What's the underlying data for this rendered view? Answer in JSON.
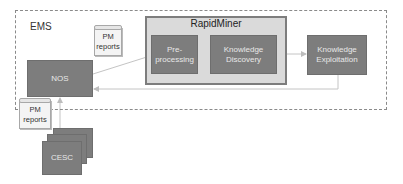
{
  "diagram": {
    "containers": {
      "ems": {
        "label": "EMS"
      },
      "rapidminer": {
        "label": "RapidMiner"
      }
    },
    "nodes": {
      "preprocessing": {
        "label": "Pre-\nprocessing",
        "line1": "Pre-",
        "line2": "processing"
      },
      "knowledge_discovery": {
        "label": "Knowledge Discovery",
        "line1": "Knowledge",
        "line2": "Discovery"
      },
      "knowledge_exploitation": {
        "label": "Knowledge Exploitation",
        "line1": "Knowledge",
        "line2": "Exploitation"
      },
      "nos": {
        "label": "NOS"
      },
      "cesc": {
        "label": "CESC"
      }
    },
    "documents": {
      "pm_reports_top": {
        "line1": "PM",
        "line2": "reports"
      },
      "pm_reports_bottom": {
        "line1": "PM",
        "line2": "reports"
      }
    },
    "edges": [
      {
        "from": "NOS",
        "to": "Pre-processing"
      },
      {
        "from": "Pre-processing",
        "to": "Knowledge Discovery"
      },
      {
        "from": "Knowledge Discovery",
        "to": "Knowledge Exploitation"
      },
      {
        "from": "Knowledge Exploitation",
        "to": "NOS"
      },
      {
        "from": "CESC",
        "to": "NOS"
      }
    ],
    "colors": {
      "node_fill": "#7d7d7d",
      "container_fill": "#dadada",
      "edge": "#bdbdbd",
      "dashed_border": "#8a8a8a"
    }
  }
}
